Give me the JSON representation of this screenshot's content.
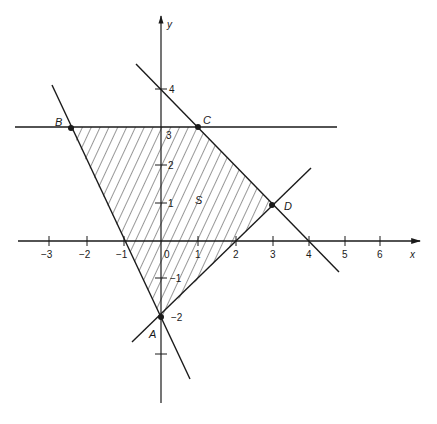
{
  "figure": {
    "type": "linear-programming-feasible-region",
    "axes": {
      "x_label": "x",
      "y_label": "y",
      "x_ticks": [
        {
          "value": -3,
          "label": "−3"
        },
        {
          "value": -2,
          "label": "−2"
        },
        {
          "value": -1,
          "label": "−1"
        },
        {
          "value": 0,
          "label": "0"
        },
        {
          "value": 1,
          "label": "1"
        },
        {
          "value": 2,
          "label": "2"
        },
        {
          "value": 3,
          "label": "3"
        },
        {
          "value": 4,
          "label": "4"
        },
        {
          "value": 5,
          "label": "5"
        },
        {
          "value": 6,
          "label": "6"
        }
      ],
      "y_ticks": [
        {
          "value": 4,
          "label": "4"
        },
        {
          "value": 3,
          "label": "3"
        },
        {
          "value": 2,
          "label": "2"
        },
        {
          "value": 1,
          "label": "1"
        },
        {
          "value": -1,
          "label": "−1"
        },
        {
          "value": -2,
          "label": "−2"
        },
        {
          "value": -3,
          "label": ""
        }
      ]
    },
    "points": {
      "A": {
        "label": "A",
        "x": 0,
        "y": -2
      },
      "B": {
        "label": "B",
        "x": -2.5,
        "y": 3
      },
      "C": {
        "label": "C",
        "x": 1,
        "y": 3
      },
      "D": {
        "label": "D",
        "x": 3,
        "y": 1
      }
    },
    "region_label": "S",
    "lines": [
      {
        "name": "y = 3",
        "description": "horizontal line through B and C"
      },
      {
        "name": "x + y = 4",
        "description": "line through C and D"
      },
      {
        "name": "y = x - 2",
        "description": "line through A and D"
      },
      {
        "name": "y = -2x - 2",
        "description": "line through A and B"
      }
    ],
    "colors": {
      "ink": "#1a1a1a",
      "background": "#ffffff"
    }
  }
}
